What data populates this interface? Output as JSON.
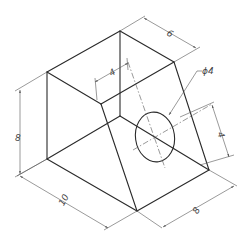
{
  "drawing": {
    "type": "isometric technical drawing",
    "object": "wedge block with through hole",
    "dimensions": {
      "top_depth": "6",
      "hole_offset_top": "4",
      "hole_diameter": "ϕ4",
      "height_left": "8",
      "hole_offset_right": "4",
      "length_front": "10",
      "width_right": "8"
    },
    "colors": {
      "edge": "#2a2a2a",
      "dimension": "#555555",
      "background": "#ffffff"
    }
  }
}
